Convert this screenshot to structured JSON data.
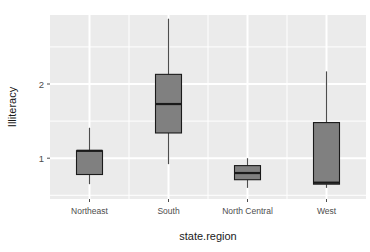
{
  "chart_data": {
    "type": "box",
    "title": "",
    "xlabel": "state.region",
    "ylabel": "Illiteracy",
    "categories": [
      "Northeast",
      "South",
      "North Central",
      "West"
    ],
    "ylim": [
      0.45,
      2.93
    ],
    "yticks": [
      1,
      2
    ],
    "ytick_labels": [
      "1",
      "2"
    ],
    "grid": true,
    "legend": "none",
    "panel_background": "#ebebeb",
    "gridline_color": "#ffffff",
    "box_fill": "#808080",
    "box_outline": "#1a1a1a",
    "median_color": "#1a1a1a",
    "whisker_color": "#4d4d4d",
    "boxes": [
      {
        "category": "Northeast",
        "whisker_low": 0.65,
        "q1": 0.78,
        "median": 1.1,
        "q3": 1.1,
        "whisker_high": 1.41
      },
      {
        "category": "South",
        "whisker_low": 0.92,
        "q1": 1.34,
        "median": 1.73,
        "q3": 2.13,
        "whisker_high": 2.88
      },
      {
        "category": "North Central",
        "whisker_low": 0.6,
        "q1": 0.71,
        "median": 0.8,
        "q3": 0.9,
        "whisker_high": 1.0
      },
      {
        "category": "West",
        "whisker_low": 0.6,
        "q1": 0.65,
        "median": 0.67,
        "q3": 1.48,
        "whisker_high": 2.17
      }
    ]
  }
}
